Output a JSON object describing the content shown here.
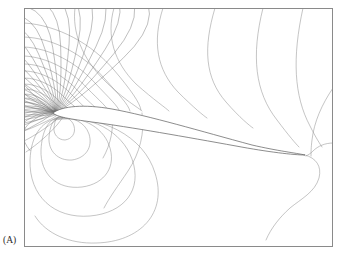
{
  "figure": {
    "panel_label": "(A)",
    "frame": {
      "x": 24,
      "y": 8,
      "width": 309,
      "height": 239
    },
    "colors": {
      "background": "#ffffff",
      "frame_stroke": "#8a8a8a",
      "contour_stroke": "#8b8b8b",
      "contour_dense_stroke": "#6f6f6f",
      "airfoil_stroke": "#5c5c5c",
      "label_text": "#2a2a2a"
    }
  },
  "chart_data": {
    "type": "line",
    "title": "",
    "subtitle": "",
    "xlabel": "",
    "ylabel": "",
    "annotations": [
      "(A)"
    ],
    "legend": [],
    "grid": false,
    "axis_ticks": [],
    "plot_kind": "potential-flow equipotential contour map around a cambered airfoil at angle of attack",
    "xlim": [
      24,
      333
    ],
    "ylim": [
      8,
      247
    ],
    "features": {
      "airfoil_leading_edge": [
        53,
        113
      ],
      "airfoil_trailing_edge": [
        305,
        155
      ],
      "chord_px": 255,
      "stagnation_point_front": [
        55,
        112
      ],
      "contour_count_visible": 34
    },
    "airfoil_outline": "M53,113 C62,106 84,104 112,109 C150,116 200,131 252,145 C278,151 296,153 305,155 C294,155 268,152 236,146 C186,137 130,127 92,122 C70,119 57,117 53,113 Z",
    "series": [
      {
        "name": "upper-arc-1",
        "path": "M24,23 C58,25 92,44 114,70 C131,90 140,103 141,110"
      },
      {
        "name": "upper-arc-2",
        "path": "M24,37 C54,38 84,55 104,78 C120,96 128,104 130,111"
      },
      {
        "name": "upper-arc-3",
        "path": "M24,47 C50,48 77,63 95,83 C110,99 118,106 120,112"
      },
      {
        "name": "upper-arc-4",
        "path": "M24,56 C47,57 71,70 87,88 C100,101 108,108 110,113"
      },
      {
        "name": "upper-arc-5",
        "path": "M24,64 C44,64 65,76 79,92 C91,104 98,109 100,113"
      },
      {
        "name": "upper-arc-6",
        "path": "M24,71 C42,71 60,82 72,95 C82,105 89,111 91,114"
      },
      {
        "name": "upper-arc-7",
        "path": "M24,78 C40,78 55,87 66,99 C75,107 81,112 84,114"
      },
      {
        "name": "upper-arc-8",
        "path": "M24,84 C38,84 51,92 60,102 C68,109 75,113 78,115"
      },
      {
        "name": "upper-arc-9",
        "path": "M24,89 C37,89 48,96 56,104 C63,110 70,114 74,115"
      },
      {
        "name": "upper-arc-10",
        "path": "M24,94 C36,94 45,100 52,107 C59,112 66,115 70,116"
      },
      {
        "name": "upper-arc-11",
        "path": "M24,98 C35,98 43,103 49,109 C55,113 62,116 67,116"
      },
      {
        "name": "upper-arc-12",
        "path": "M24,102 C34,102 41,106 46,110 C52,114 59,116 64,117"
      },
      {
        "name": "left-fan-1",
        "path": "M24,107 C34,107 42,109 49,112 C53,113 55,113 56,113"
      },
      {
        "name": "left-fan-2",
        "path": "M24,112 C34,112 43,113 51,114 C54,114 55,114 56,114"
      },
      {
        "name": "left-fan-3",
        "path": "M24,117 C34,116 43,115 51,115 C54,115 55,114 56,114"
      },
      {
        "name": "left-fan-4",
        "path": "M24,123 C34,121 44,118 52,116 C55,115 56,115 57,114"
      },
      {
        "name": "left-fan-5",
        "path": "M24,131 C35,127 45,122 53,118 C56,116 57,115 58,115"
      },
      {
        "name": "left-fan-6",
        "path": "M24,141 C36,135 47,127 55,121 C58,118 60,116 61,115"
      },
      {
        "name": "left-fan-7",
        "path": "M26,152 C38,144 49,134 57,125 C61,120 63,117 64,116"
      },
      {
        "name": "big-outer-top",
        "path": "M75,8 C72,32 82,58 104,80 C124,100 139,108 142,111"
      },
      {
        "name": "big-outer-top-2",
        "path": "M114,8 C106,36 114,62 136,84 C154,100 166,108 169,111"
      },
      {
        "name": "big-outer-top-3",
        "path": "M163,8 C152,42 157,70 178,92 C194,108 204,116 207,118"
      },
      {
        "name": "big-outer-top-4",
        "path": "M215,8 C203,48 205,78 226,102 C240,118 250,126 253,128"
      },
      {
        "name": "right-vertical-1",
        "path": "M263,8 C251,56 255,92 277,120 C289,136 296,144 299,147"
      },
      {
        "name": "right-vertical-2",
        "path": "M303,8 C292,58 294,96 310,126 C316,138 320,144 322,147"
      },
      {
        "name": "right-corner-arc",
        "path": "M333,88 C322,104 314,122 312,140 C311,148 311,152 311,156"
      },
      {
        "name": "right-edge-exit",
        "path": "M333,143 C325,143 318,146 313,151 C310,154 308,155 306,156"
      },
      {
        "name": "trailing-s-curve",
        "path": "M305,155 C316,158 322,166 319,178 C315,192 301,199 290,208 C280,217 271,228 266,240"
      },
      {
        "name": "lower-loop-1",
        "path": "M58,117 C65,116 72,119 74,126 C76,133 72,139 65,140 C58,140 53,134 54,127 C55,121 56,118 58,117"
      },
      {
        "name": "lower-loop-2",
        "path": "M57,118 C72,116 85,122 89,134 C93,147 86,158 72,160 C58,161 48,151 49,137 C50,126 53,120 57,118"
      },
      {
        "name": "lower-loop-3",
        "path": "M56,118 C80,115 102,126 109,145 C117,166 105,184 82,187 C57,190 40,174 41,150 C42,131 48,121 56,118"
      },
      {
        "name": "lower-loop-4",
        "path": "M55,119 C90,114 122,131 132,159 C143,190 124,213 90,216 C54,219 29,196 30,160 C31,135 42,122 55,119"
      },
      {
        "name": "lower-loop-5",
        "path": "M54,120 C100,113 144,136 155,173 C168,213 140,242 96,243 C70,244 46,234 35,216"
      },
      {
        "name": "lower-mid-line",
        "path": "M142,113 C145,132 140,153 128,171 C118,186 109,198 104,208"
      },
      {
        "name": "lower-mid-line-2",
        "path": "M112,112 C114,128 111,144 103,158"
      }
    ]
  }
}
